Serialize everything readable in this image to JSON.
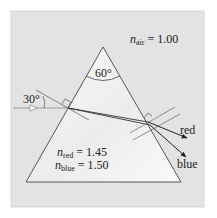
{
  "diagram": {
    "apex_angle": "60°",
    "incidence_angle": "30°",
    "n_air": {
      "symbol": "n",
      "sub": "air",
      "value": "= 1.00"
    },
    "n_red": {
      "symbol": "n",
      "sub": "red",
      "value": "= 1.45"
    },
    "n_blue": {
      "symbol": "n",
      "sub": "blue",
      "value": "= 1.50"
    },
    "ray_labels": {
      "red": "red",
      "blue": "blue"
    },
    "colors": {
      "panel": "#e6e6e6",
      "prism": "#f7f7f7",
      "lines": "#333333",
      "border": "#cccccc"
    }
  }
}
